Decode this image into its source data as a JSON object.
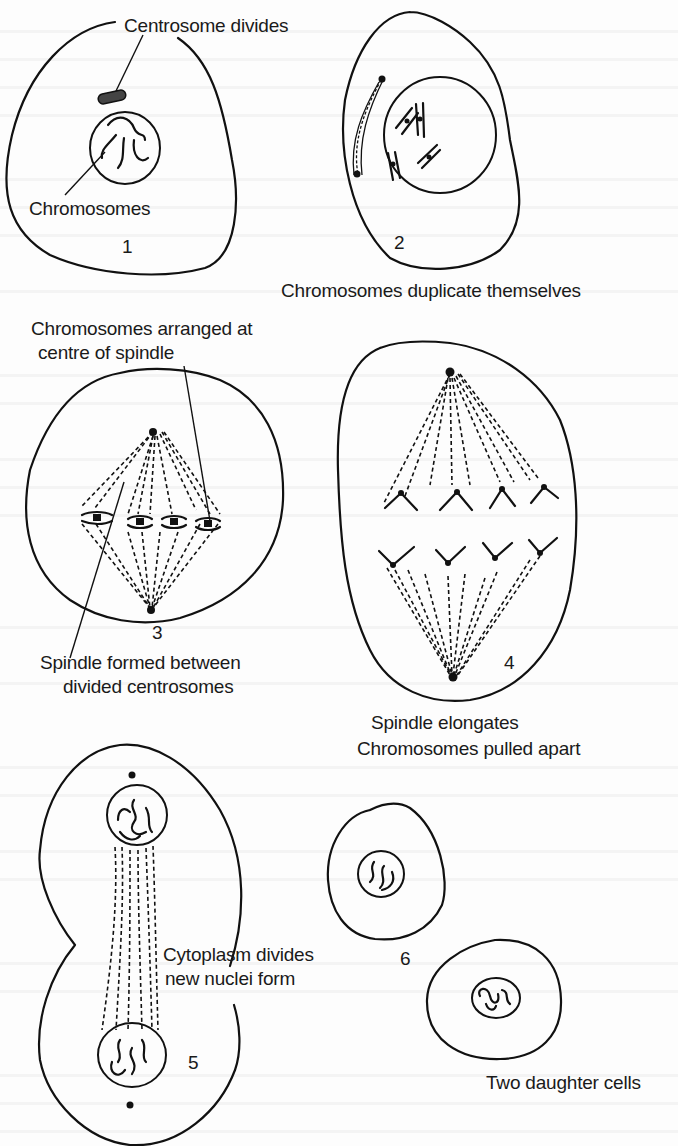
{
  "figure": {
    "stages": [
      {
        "number": "1",
        "labels": [
          "Centrosome divides",
          "Chromosomes"
        ]
      },
      {
        "number": "2",
        "caption": "Chromosomes duplicate themselves"
      },
      {
        "number": "3",
        "top_caption": [
          "Chromosomes arranged at",
          "centre of spindle"
        ],
        "bottom_caption": [
          "Spindle formed between",
          "divided centrosomes"
        ]
      },
      {
        "number": "4",
        "caption": [
          "Spindle elongates",
          "Chromosomes pulled apart"
        ]
      },
      {
        "number": "5",
        "caption": [
          "Cytoplasm divides",
          "new nuclei form"
        ]
      },
      {
        "number": "6",
        "caption": "Two daughter cells"
      }
    ]
  },
  "colors": {
    "ink": "#111111",
    "paper": "#fdfdfd"
  }
}
